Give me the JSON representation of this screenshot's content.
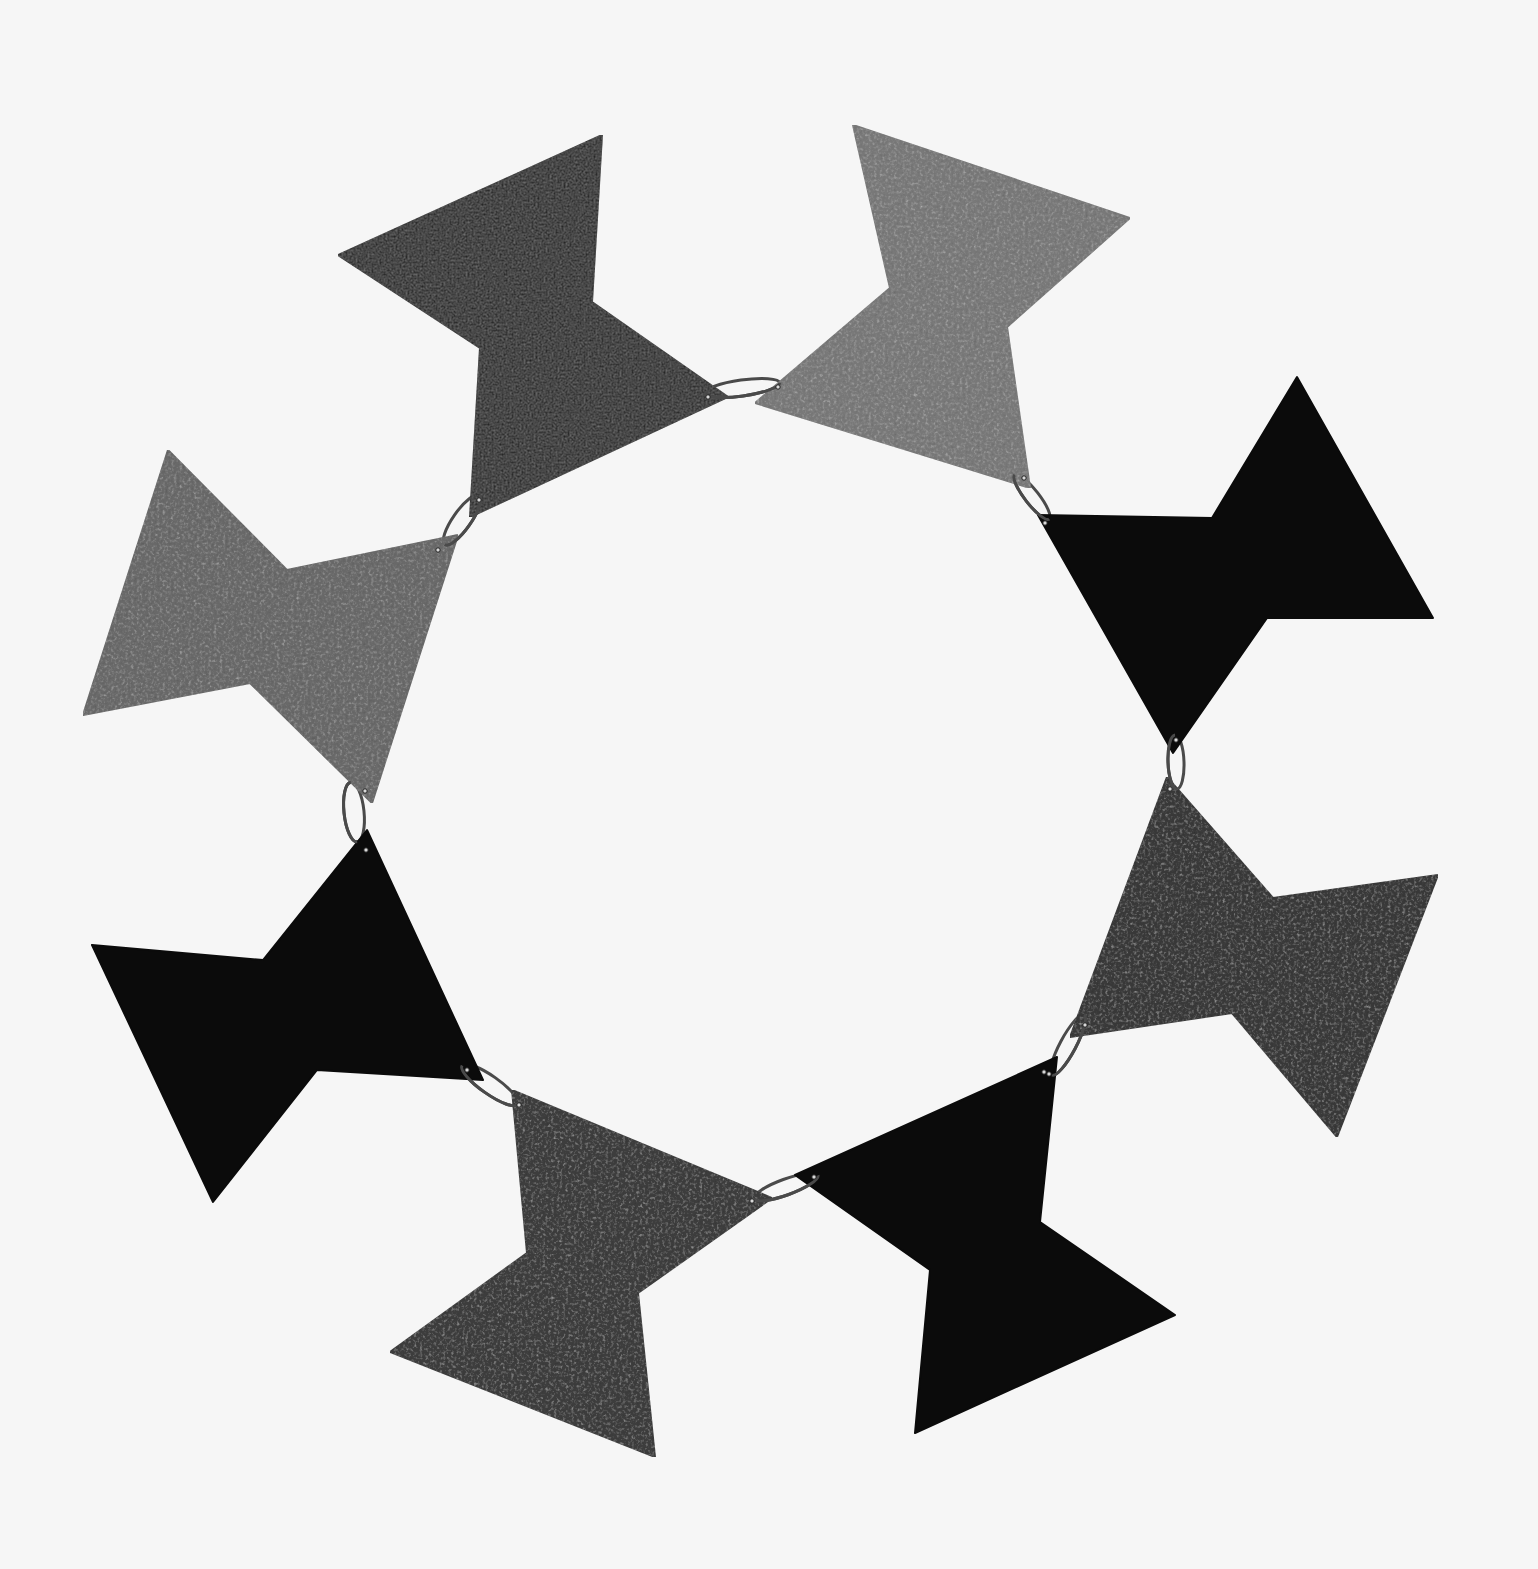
{
  "image": {
    "subject": "Necklace of eight linked bow-tie shaped metal plates arranged in a circle",
    "background_color": "#f6f6f6",
    "width": 1538,
    "height": 1569
  },
  "palette": {
    "black_plate": "#0b0b0b",
    "gray_plate_light": "#7a7a7a",
    "gray_plate_mid": "#5e5e5e",
    "gray_plate_dark": "#3a3a3a",
    "ring": "#4a4a4a",
    "hole": "#d8d8d8"
  },
  "pieces": [
    {
      "id": "top-left-black",
      "fill": "#0b0b0b",
      "texture": "speckle-light",
      "points": "602,135 592,302 728,397 470,517 480,348 338,255"
    },
    {
      "id": "top-right-gray",
      "fill": "#7a7a7a",
      "texture": "speckle",
      "points": "853,125 1130,218 1007,327 1030,488 755,403 890,288"
    },
    {
      "id": "right-black",
      "fill": "#0b0b0b",
      "texture": "none",
      "points": "1038,515 1212,518 1297,377 1433,618 1267,618 1173,753"
    },
    {
      "id": "lower-right-gray",
      "fill": "#3a3a3a",
      "texture": "speckle",
      "points": "1167,777 1273,898 1438,875 1337,1137 1232,1013 1070,1037"
    },
    {
      "id": "bottom-right-black",
      "fill": "#0b0b0b",
      "texture": "none",
      "points": "1057,1057 1040,1222 1175,1315 915,1433 930,1270 795,1175"
    },
    {
      "id": "bottom-left-gray",
      "fill": "#3e3e3e",
      "texture": "speckle",
      "points": "512,1090 772,1198 638,1293 655,1457 390,1352 527,1253"
    },
    {
      "id": "left-black",
      "fill": "#0b0b0b",
      "texture": "none",
      "points": "367,830 483,1080 317,1070 213,1202 92,945 263,960"
    },
    {
      "id": "upper-left-gray",
      "fill": "#6a6a6a",
      "texture": "speckle",
      "points": "168,450 287,570 458,535 372,803 250,683 83,715"
    }
  ],
  "rings": [
    {
      "id": "ring-1-2",
      "cx": 742,
      "cy": 388,
      "rx": 38,
      "ry": 8,
      "rotate": -8
    },
    {
      "id": "ring-2-3",
      "cx": 1032,
      "cy": 497,
      "rx": 28,
      "ry": 7,
      "rotate": 52
    },
    {
      "id": "ring-3-4",
      "cx": 1176,
      "cy": 762,
      "rx": 27,
      "ry": 8,
      "rotate": 88
    },
    {
      "id": "ring-4-5",
      "cx": 1068,
      "cy": 1045,
      "rx": 34,
      "ry": 8,
      "rotate": -62
    },
    {
      "id": "ring-5-6",
      "cx": 786,
      "cy": 1187,
      "rx": 34,
      "ry": 8,
      "rotate": -20
    },
    {
      "id": "ring-6-7",
      "cx": 490,
      "cy": 1085,
      "rx": 34,
      "ry": 9,
      "rotate": 35
    },
    {
      "id": "ring-7-8",
      "cx": 354,
      "cy": 812,
      "rx": 30,
      "ry": 10,
      "rotate": 84
    },
    {
      "id": "ring-8-1",
      "cx": 462,
      "cy": 520,
      "rx": 30,
      "ry": 9,
      "rotate": -55
    }
  ],
  "holes": [
    {
      "cx": 708,
      "cy": 397
    },
    {
      "cx": 778,
      "cy": 387
    },
    {
      "cx": 1024,
      "cy": 478
    },
    {
      "cx": 1045,
      "cy": 523
    },
    {
      "cx": 1176,
      "cy": 740
    },
    {
      "cx": 1170,
      "cy": 789
    },
    {
      "cx": 1085,
      "cy": 1025
    },
    {
      "cx": 1049,
      "cy": 1074
    },
    {
      "cx": 1044,
      "cy": 1072
    },
    {
      "cx": 814,
      "cy": 1177
    },
    {
      "cx": 752,
      "cy": 1201
    },
    {
      "cx": 519,
      "cy": 1105
    },
    {
      "cx": 467,
      "cy": 1070
    },
    {
      "cx": 366,
      "cy": 850
    },
    {
      "cx": 365,
      "cy": 791
    },
    {
      "cx": 438,
      "cy": 550
    },
    {
      "cx": 479,
      "cy": 500
    }
  ]
}
